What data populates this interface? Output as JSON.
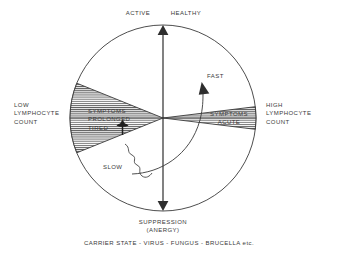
{
  "diagram": {
    "title_top_left": "ACTIVE",
    "title_top_right": "HEALTHY",
    "axis_top_labels": [
      "ACTIVE",
      "HEALTHY"
    ],
    "left_axis_label": "LOW\nLYMPHOCYTE\nCOUNT",
    "right_axis_label": "HIGH\nLYMPHOCYTE\nCOUNT",
    "left_wedge_label": "SYMPTOMS\nPROLONGED\nTIRED",
    "right_wedge_label": "SYMPTOMS\nACUTE",
    "fast_label": "FAST",
    "slow_label": "SLOW",
    "bottom_axis_label": "SUPPRESSION\n(ANERGY)",
    "caption": "CARRIER STATE - VIRUS - FUNGUS - BRUCELLA etc.",
    "colors": {
      "stroke": "#3a3a3a",
      "text": "#3a3a3a",
      "hatch": "#555555",
      "background": "#ffffff"
    },
    "geometry": {
      "center_x": 163,
      "center_y": 118,
      "radius": 93,
      "left_wedge_half_angle_deg": 22,
      "right_wedge_half_angle_deg": 7
    }
  }
}
